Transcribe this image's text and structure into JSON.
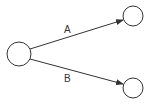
{
  "diagram": {
    "type": "directed-graph",
    "nodes": [
      {
        "id": "source",
        "label": "",
        "cx": 19,
        "cy": 54,
        "r": 12
      },
      {
        "id": "target-a",
        "label": "",
        "cx": 133,
        "cy": 16,
        "r": 10
      },
      {
        "id": "target-b",
        "label": "",
        "cx": 133,
        "cy": 88,
        "r": 10
      }
    ],
    "edges": [
      {
        "from": "source",
        "to": "target-a",
        "label": "A"
      },
      {
        "from": "source",
        "to": "target-b",
        "label": "B"
      }
    ],
    "colors": {
      "stroke": "#333333",
      "background": "#ffffff"
    }
  }
}
